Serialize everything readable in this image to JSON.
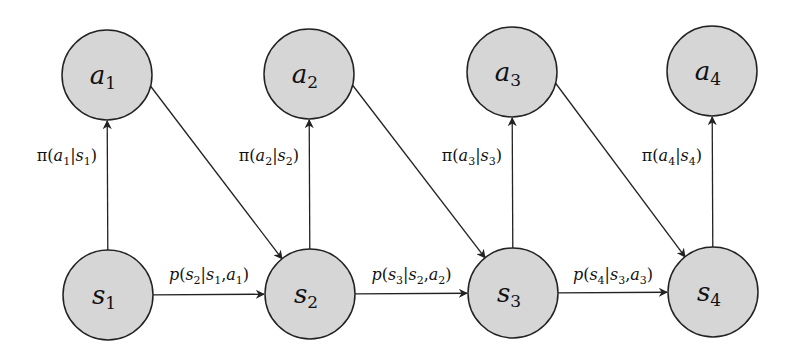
{
  "diagram": {
    "title": "",
    "action_nodes": [
      {
        "id": "a1",
        "symbol": "a",
        "sub": "1"
      },
      {
        "id": "a2",
        "symbol": "a",
        "sub": "2"
      },
      {
        "id": "a3",
        "symbol": "a",
        "sub": "3"
      },
      {
        "id": "a4",
        "symbol": "a",
        "sub": "4"
      }
    ],
    "state_nodes": [
      {
        "id": "s1",
        "symbol": "s",
        "sub": "1"
      },
      {
        "id": "s2",
        "symbol": "s",
        "sub": "2"
      },
      {
        "id": "s3",
        "symbol": "s",
        "sub": "3"
      },
      {
        "id": "s4",
        "symbol": "s",
        "sub": "4"
      }
    ],
    "policy_edges": [
      {
        "from": "s1",
        "to": "a1",
        "label": "π(a1|s1)",
        "a": "1",
        "s": "1"
      },
      {
        "from": "s2",
        "to": "a2",
        "label": "π(a2|s2)",
        "a": "2",
        "s": "2"
      },
      {
        "from": "s3",
        "to": "a3",
        "label": "π(a3|s3)",
        "a": "3",
        "s": "3"
      },
      {
        "from": "s4",
        "to": "a4",
        "label": "π(a4|s4)",
        "a": "4",
        "s": "4"
      }
    ],
    "action_to_state_edges": [
      {
        "from": "a1",
        "to": "s2"
      },
      {
        "from": "a2",
        "to": "s3"
      },
      {
        "from": "a3",
        "to": "s4"
      }
    ],
    "transition_edges": [
      {
        "from": "s1",
        "to": "s2",
        "label": "p(s2|s1,a1)",
        "next": "2",
        "cur": "1",
        "act": "1"
      },
      {
        "from": "s2",
        "to": "s3",
        "label": "p(s3|s2,a2)",
        "next": "3",
        "cur": "2",
        "act": "2"
      },
      {
        "from": "s3",
        "to": "s4",
        "label": "p(s4|s3,a3)",
        "next": "4",
        "cur": "3",
        "act": "3"
      }
    ],
    "colors": {
      "node_fill": "#d6d6d6",
      "stroke": "#222222"
    }
  }
}
